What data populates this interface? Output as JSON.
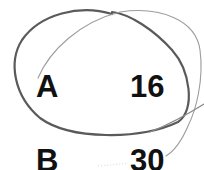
{
  "rows": [
    {
      "label": "A",
      "value": "16"
    },
    {
      "label": "B",
      "value": "30"
    }
  ],
  "strokes": {
    "dark_loop_color": "#555555",
    "light_loop_color": "#9a9a9a",
    "text_color": "#111111"
  }
}
